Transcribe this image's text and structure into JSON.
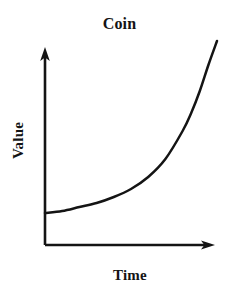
{
  "figure": {
    "title": "Coin",
    "background_color": "#ffffff",
    "ink_color": "#141414"
  },
  "axes": {
    "x_label": "Time",
    "y_label": "Value",
    "x_axis_name": "x-axis-arrow",
    "y_axis_name": "y-axis-arrow",
    "arrowheads": "both",
    "ticks": "none",
    "grid": "off"
  },
  "chart_data": {
    "type": "line",
    "title": "Coin",
    "xlabel": "Time",
    "ylabel": "Value",
    "xlim": [
      0,
      100
    ],
    "ylim": [
      0,
      100
    ],
    "grid": false,
    "legend": "none",
    "axis_tick_labels": {
      "x": [],
      "y": []
    },
    "annotation": "Exponential growth curve: value stays nearly flat over early time then rises sharply.",
    "series": [
      {
        "name": "Coin value",
        "color": "#141414",
        "x": [
          0,
          10,
          20,
          30,
          40,
          50,
          60,
          70,
          80,
          85,
          90,
          95,
          100
        ],
        "values": [
          16,
          17,
          19,
          21,
          24,
          28,
          34,
          43,
          57,
          66,
          77,
          90,
          102
        ]
      }
    ]
  }
}
